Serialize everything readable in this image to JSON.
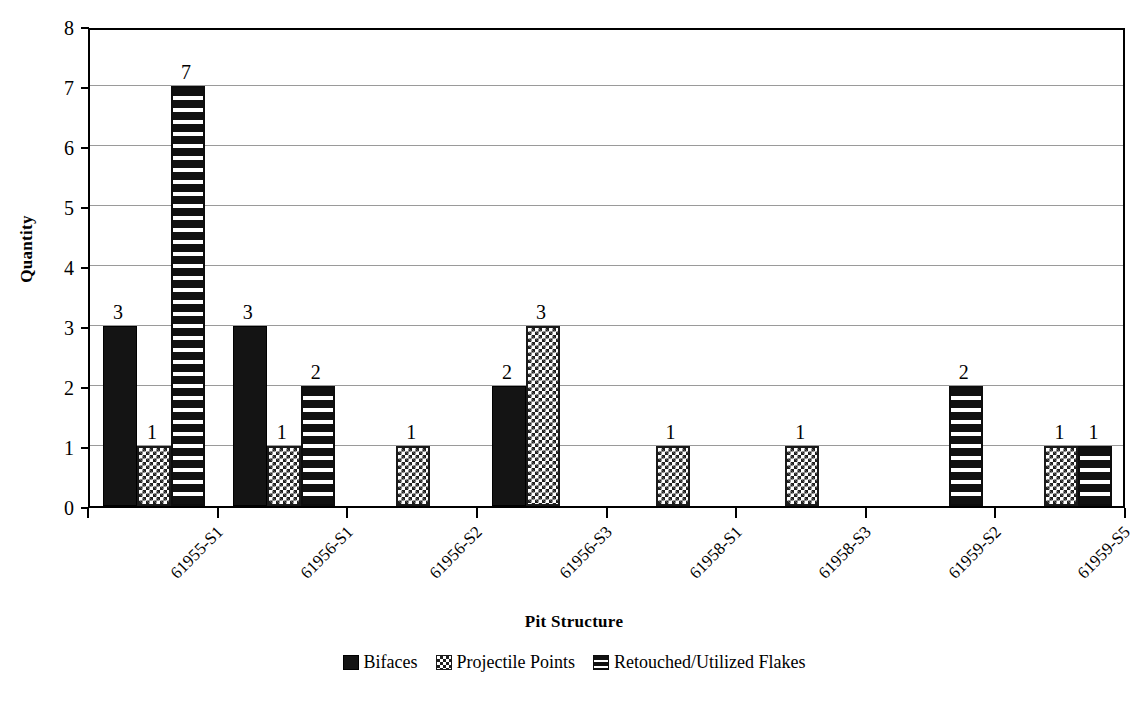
{
  "chart_data": {
    "type": "bar",
    "title": "",
    "xlabel": "Pit Structure",
    "ylabel": "Quantity",
    "ylim": [
      0,
      8
    ],
    "ytick_labels": [
      "0",
      "1",
      "2",
      "3",
      "4",
      "5",
      "6",
      "7",
      "8"
    ],
    "grid": true,
    "legend_position": "bottom",
    "categories": [
      "61955-S1",
      "61956-S1",
      "61956-S2",
      "61956-S3",
      "61958-S1",
      "61958-S3",
      "61959-S2",
      "61959-S5"
    ],
    "series": [
      {
        "name": "Bifaces",
        "pattern": "solid",
        "values": [
          3,
          3,
          0,
          2,
          0,
          0,
          0,
          0
        ],
        "labels": [
          "3",
          "3",
          "",
          "2",
          "",
          "",
          "",
          ""
        ]
      },
      {
        "name": "Projectile Points",
        "pattern": "checker",
        "values": [
          1,
          1,
          1,
          3,
          1,
          1,
          0,
          1
        ],
        "labels": [
          "1",
          "1",
          "1",
          "3",
          "1",
          "1",
          "",
          "1"
        ]
      },
      {
        "name": "Retouched/Utilized Flakes",
        "pattern": "stripe",
        "values": [
          7,
          2,
          0,
          0,
          0,
          0,
          2,
          1
        ],
        "labels": [
          "7",
          "2",
          "",
          "",
          "",
          "",
          "2",
          "1"
        ]
      }
    ]
  },
  "colors": {
    "bar_dark": "#141414",
    "grid": "#9a9a9a",
    "axis": "#000000",
    "background": "#ffffff"
  }
}
